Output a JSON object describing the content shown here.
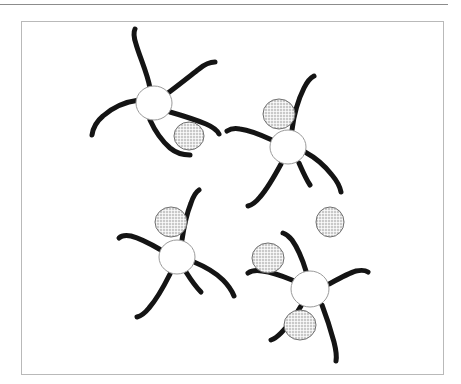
{
  "figure": {
    "kind": "scientific-illustration",
    "caption_rule_present": true,
    "frame": {
      "x": 21,
      "y": 21,
      "width": 423,
      "height": 354,
      "border_color": "#b9b9b9",
      "background": "#ffffff"
    },
    "top_rule": {
      "x": 0,
      "y": 4,
      "width": 448,
      "color": "#8c8c8c",
      "thickness": 1.6
    },
    "palette": {
      "background": "#ffffff",
      "soma_fill": "#ffffff",
      "soma_stroke": "#9a9a9a",
      "process_stroke": "#141414",
      "granule_fill": "#c9c9c9",
      "granule_hatch": "#ffffff",
      "granule_stroke": "#6f6f6f",
      "frame_stroke": "#b9b9b9",
      "rule_stroke": "#8c8c8c"
    },
    "legend_labels": [],
    "annotations": [],
    "cells": [
      {
        "id": "cell-top-left",
        "soma": {
          "cx": 154,
          "cy": 103,
          "rx": 18,
          "ry": 17
        },
        "processes": [
          "M 150 88 C 147 72 140 58 136 44 C 134 38 133 33 135 29",
          "M 168 93 C 180 84 190 76 199 69 C 205 64 210 62 215 62",
          "M 139 100 C 124 102 112 108 103 116 C 97 121 93 128 92 135",
          "M 150 120 C 155 131 162 141 170 148 C 176 153 183 155 190 155",
          "M 170 112 C 184 116 196 120 206 124 C 213 127 217 130 219 134"
        ],
        "granules": [
          {
            "cx": 189,
            "cy": 136,
            "rx": 15,
            "ry": 14
          }
        ]
      },
      {
        "id": "cell-top-right",
        "soma": {
          "cx": 288,
          "cy": 147,
          "rx": 18,
          "ry": 17
        },
        "processes": [
          "M 292 130 C 294 114 298 100 304 88 C 307 82 310 78 314 76",
          "M 272 140 C 259 134 248 130 240 129 C 234 128 230 129 227 131",
          "M 281 164 C 274 177 267 189 260 197 C 256 202 252 205 248 206",
          "M 305 152 C 316 158 325 166 332 175 C 337 181 340 187 341 192",
          "M 299 163 C 303 172 306 179 310 185"
        ],
        "granules": [
          {
            "cx": 279,
            "cy": 114,
            "rx": 16,
            "ry": 15
          }
        ]
      },
      {
        "id": "cell-bottom-left",
        "soma": {
          "cx": 177,
          "cy": 257,
          "rx": 18,
          "ry": 17
        },
        "processes": [
          "M 182 240 C 184 226 187 213 191 203 C 193 197 196 192 199 190",
          "M 161 250 C 149 243 139 238 131 236 C 125 235 121 236 119 238",
          "M 170 274 C 163 288 156 300 149 308 C 145 313 141 316 137 317",
          "M 194 262 C 206 267 216 273 223 280 C 229 286 232 291 234 296",
          "M 186 272 C 191 280 196 287 201 292"
        ],
        "granules": [
          {
            "cx": 171,
            "cy": 222,
            "rx": 16,
            "ry": 15
          }
        ]
      },
      {
        "id": "cell-bottom-right",
        "soma": {
          "cx": 310,
          "cy": 289,
          "rx": 19,
          "ry": 18
        },
        "processes": [
          "M 306 271 C 302 258 297 247 292 240 C 289 236 286 234 283 233",
          "M 292 280 C 280 275 270 272 262 271 C 256 270 251 271 248 273",
          "M 301 306 C 294 318 287 327 281 333 C 277 337 274 339 271 340",
          "M 329 284 C 340 278 349 273 356 271 C 361 270 365 270 368 272",
          "M 322 305 C 327 318 331 331 334 342 C 336 350 337 356 336 361"
        ],
        "granules": [
          {
            "cx": 268,
            "cy": 258,
            "rx": 16,
            "ry": 15
          },
          {
            "cx": 300,
            "cy": 325,
            "rx": 16,
            "ry": 15
          }
        ]
      }
    ],
    "free_granules": [
      {
        "id": "granule-free-right",
        "cx": 330,
        "cy": 222,
        "rx": 14,
        "ry": 15
      }
    ]
  }
}
